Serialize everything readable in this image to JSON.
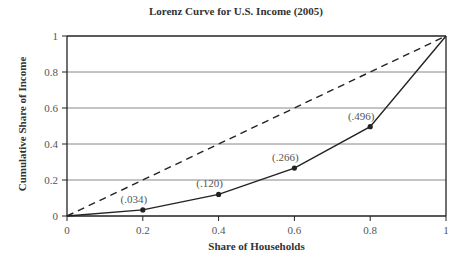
{
  "chart_data": {
    "type": "line",
    "title": "Lorenz Curve for U.S. Income (2005)",
    "xlabel": "Share of Households",
    "ylabel": "Cumulative Share of Income",
    "xlim": [
      0,
      1
    ],
    "ylim": [
      0,
      1
    ],
    "x_ticks": [
      "0",
      "0.2",
      "0.4",
      "0.6",
      "0.8",
      "1"
    ],
    "y_ticks": [
      "0",
      "0.2",
      "0.4",
      "0.6",
      "0.8",
      "1"
    ],
    "grid": "horizontal",
    "legend": null,
    "series": [
      {
        "name": "Lorenz curve",
        "style": "solid",
        "markers": true,
        "x": [
          0,
          0.2,
          0.4,
          0.6,
          0.8,
          1.0
        ],
        "y": [
          0,
          0.034,
          0.12,
          0.266,
          0.496,
          1.0
        ]
      },
      {
        "name": "Line of equality",
        "style": "dashed",
        "markers": false,
        "x": [
          0,
          1
        ],
        "y": [
          0,
          1
        ]
      }
    ],
    "annotations": [
      {
        "x": 0.2,
        "y": 0.034,
        "text": "(.034)"
      },
      {
        "x": 0.4,
        "y": 0.12,
        "text": "(.120)"
      },
      {
        "x": 0.6,
        "y": 0.266,
        "text": "(.266)"
      },
      {
        "x": 0.8,
        "y": 0.496,
        "text": "(.496)"
      }
    ]
  },
  "colors": {
    "axis": "#222222",
    "grid": "#888888",
    "curve": "#222222",
    "text": "#444444"
  }
}
